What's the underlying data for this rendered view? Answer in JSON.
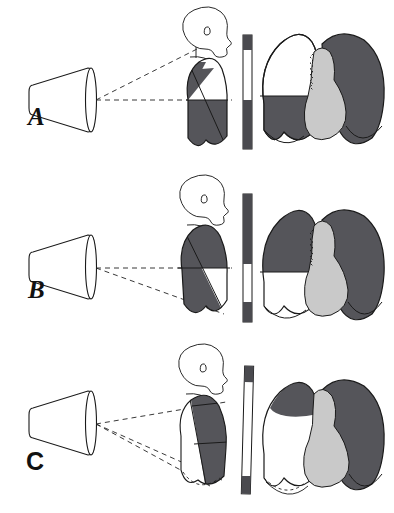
{
  "figure": {
    "title": "",
    "background": "#ffffff",
    "width": 394,
    "height": 513
  },
  "colors": {
    "lung_opacity_dark": "#55555a",
    "lung_opacity_dark_alt": "#4e4e53",
    "heart_gray": "#c9c9c9",
    "air_white": "#ffffff",
    "outline": "#1a1a1a",
    "beam_dash": "#222222",
    "cassette_dark": "#4a4a4f"
  },
  "panels": [
    {
      "id": "A",
      "label": "A",
      "label_style": "italic",
      "label_x": 28,
      "label_y": 112,
      "tube": {
        "name": "x-ray-tube-cone",
        "orientation": "horizontal"
      },
      "beam": {
        "rays": 2,
        "style": "dashed",
        "direction": "horizontal-and-upward"
      },
      "patient": {
        "view": "lateral-silhouette",
        "head": "profile-facing-right",
        "posture": "upright"
      },
      "cassette": {
        "name": "film-cassette",
        "tilt": 0,
        "segments": [
          "dark",
          "white",
          "dark"
        ]
      },
      "radiograph": {
        "view": "frontal-chest",
        "left_lung_field": "air-above-fluid",
        "right_lung_field": "opacified",
        "fluid_level": "horizontal-meniscus-mid",
        "heart": "central-light-gray"
      }
    },
    {
      "id": "B",
      "label": "B",
      "label_style": "italic",
      "label_x": 28,
      "label_y": 285,
      "tube": {
        "name": "x-ray-tube-cone",
        "orientation": "horizontal"
      },
      "beam": {
        "rays": 2,
        "style": "dashed",
        "direction": "horizontal-and-downward"
      },
      "patient": {
        "view": "lateral-silhouette",
        "head": "profile-facing-right",
        "posture": "supine"
      },
      "cassette": {
        "name": "film-cassette",
        "tilt": 0,
        "segments": [
          "dark",
          "white",
          "dark"
        ]
      },
      "radiograph": {
        "view": "frontal-chest",
        "left_lung_field": "opacified-above-air",
        "right_lung_field": "opacified",
        "fluid_level": "horizontal-layering-low",
        "heart": "central-light-gray"
      }
    },
    {
      "id": "C",
      "label": "C",
      "label_style": "upright",
      "label_x": 28,
      "label_y": 455,
      "tube": {
        "name": "x-ray-tube-cone",
        "orientation": "horizontal"
      },
      "beam": {
        "rays": 3,
        "style": "dashed",
        "direction": "fan-upward-and-downward"
      },
      "patient": {
        "view": "lateral-silhouette",
        "head": "profile-facing-right",
        "posture": "decubitus-tilted"
      },
      "cassette": {
        "name": "film-cassette",
        "tilt": 2,
        "segments": [
          "dark",
          "white",
          "dark"
        ]
      },
      "radiograph": {
        "view": "frontal-chest",
        "left_lung_field": "clear-with-apical-cap",
        "right_lung_field": "opacified",
        "fluid_level": "dependent-layering",
        "heart": "central-light-gray"
      }
    }
  ]
}
